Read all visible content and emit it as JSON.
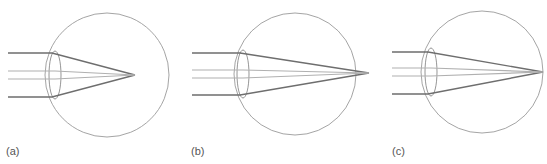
{
  "figure": {
    "colors": {
      "eyeball": "#9a9a9a",
      "lens": "#8a8a8a",
      "outer_ray": "#6e6e6e",
      "inner_ray": "#b0b0b0",
      "label": "#555555"
    },
    "panels": [
      {
        "label": "(a)",
        "label_pos": [
          6,
          146
        ],
        "eye": {
          "cx": 107,
          "cy": 75,
          "r": 62
        },
        "lens": {
          "cx": 55,
          "cy": 75,
          "rx": 6,
          "ry": 24
        },
        "ray_start_x": 8,
        "outer_ray_y": [
          53,
          97
        ],
        "inner_ray_y": [
          71,
          79
        ],
        "lens_exit_x": 52,
        "focal_point": [
          135,
          75
        ]
      },
      {
        "label": "(b)",
        "label_pos": [
          191,
          146
        ],
        "eye": {
          "cx": 295,
          "cy": 74,
          "r": 61
        },
        "lens": {
          "cx": 243,
          "cy": 74,
          "rx": 6,
          "ry": 24
        },
        "ray_start_x": 192,
        "outer_ray_y": [
          53,
          95
        ],
        "inner_ray_y": [
          70,
          78
        ],
        "lens_exit_x": 240,
        "focal_point": [
          369,
          73
        ]
      },
      {
        "label": "(c)",
        "label_pos": [
          392,
          146
        ],
        "eye": {
          "cx": 482,
          "cy": 72,
          "r": 61
        },
        "lens": {
          "cx": 431,
          "cy": 72,
          "rx": 6,
          "ry": 24
        },
        "ray_start_x": 392,
        "outer_ray_y": [
          52,
          94
        ],
        "inner_ray_y": [
          68,
          76
        ],
        "lens_exit_x": 428,
        "focal_point": [
          543,
          72
        ]
      }
    ]
  }
}
